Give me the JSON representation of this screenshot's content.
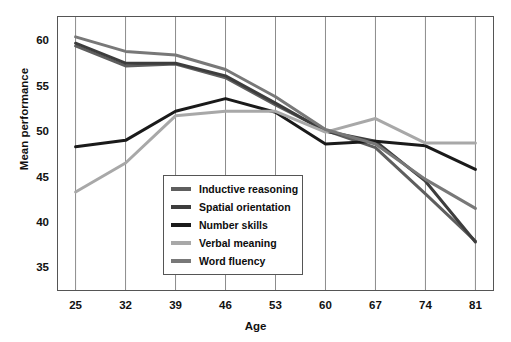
{
  "chart_data": {
    "type": "line",
    "title": "",
    "xlabel": "Age",
    "ylabel": "Mean performance",
    "x": [
      25,
      32,
      39,
      46,
      53,
      60,
      67,
      74,
      81
    ],
    "xtick_labels": [
      "25",
      "32",
      "39",
      "46",
      "53",
      "60",
      "67",
      "74",
      "81"
    ],
    "ytick_labels": [
      "60",
      "55",
      "50",
      "45",
      "40",
      "35"
    ],
    "ylim": [
      32.5,
      62.8
    ],
    "xlim": [
      22.4,
      83.6
    ],
    "grid": "vertical-only",
    "legend_position": "center-left-inside",
    "series": [
      {
        "name": "Inductive reasoning",
        "color": "#5e5e5e",
        "values": [
          59.5,
          57.3,
          57.5,
          56.0,
          53.0,
          50.2,
          48.3,
          43.2,
          38.0
        ]
      },
      {
        "name": "Spatial orientation",
        "color": "#3d3d3d",
        "values": [
          59.8,
          57.6,
          57.6,
          56.2,
          53.2,
          50.1,
          49.0,
          44.6,
          37.9
        ]
      },
      {
        "name": "Number skills",
        "color": "#1a1a1a",
        "values": [
          48.4,
          49.1,
          52.3,
          53.7,
          52.2,
          48.7,
          49.0,
          48.5,
          45.9
        ]
      },
      {
        "name": "Verbal meaning",
        "color": "#a8a8a8",
        "values": [
          43.4,
          46.6,
          51.8,
          52.3,
          52.3,
          50.0,
          51.5,
          48.8,
          48.8
        ]
      },
      {
        "name": "Word fluency",
        "color": "#787878",
        "values": [
          60.5,
          58.9,
          58.5,
          56.9,
          53.9,
          50.3,
          48.7,
          44.8,
          41.6
        ]
      }
    ]
  },
  "axes": {
    "x_label": "Age",
    "y_label": "Mean performance"
  },
  "legend": {
    "items": [
      {
        "label": "Inductive reasoning",
        "swatch": "legend-line-inductive-reasoning"
      },
      {
        "label": "Spatial orientation",
        "swatch": "legend-line-spatial-orientation"
      },
      {
        "label": "Number skills",
        "swatch": "legend-line-number-skills"
      },
      {
        "label": "Verbal meaning",
        "swatch": "legend-line-verbal-meaning"
      },
      {
        "label": "Word fluency",
        "swatch": "legend-line-word-fluency"
      }
    ]
  },
  "style": {
    "frame_color": "#555555",
    "gridline_color": "#8c8c8c",
    "background": "#ffffff"
  }
}
